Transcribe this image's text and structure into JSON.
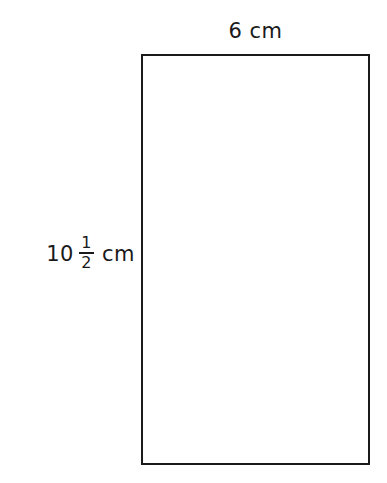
{
  "figure": {
    "type": "rectangle",
    "background_color": "#ffffff",
    "stroke_color": "#1a1a1a",
    "fill_color": "#ffffff",
    "text_color": "#1a1a1a",
    "width_label": {
      "value": "6",
      "unit": "cm",
      "full_text": "6 cm"
    },
    "height_label": {
      "whole": "10",
      "fraction_numerator": "1",
      "fraction_denominator": "2",
      "unit": "cm",
      "full_text": "10 1/2 cm"
    }
  },
  "chart_data": {
    "type": "diagram",
    "shape": "rectangle",
    "dimensions": {
      "width": 6,
      "height": 10.5,
      "unit": "cm"
    },
    "labels": [
      "6 cm",
      "10 1/2 cm"
    ],
    "title": ""
  }
}
